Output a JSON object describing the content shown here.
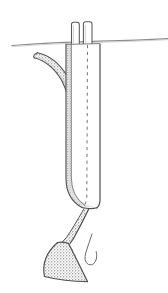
{
  "figure": {
    "title": "Burrowing organism in sediment — schematic line drawing",
    "background_color": "#ffffff",
    "width": 168,
    "height": 293,
    "ink_color": "#4a4a4a",
    "outline_color": "#3f3f3f",
    "stipple_color": "#a8a8a8",
    "stipple_fill": "#bcbcbc",
    "dashed_color": "#6b6b6b",
    "surface_line_color": "#8a8a8a",
    "caption": ""
  },
  "parts": {
    "surface_line": {
      "label": "sediment-surface-line",
      "description": "Slightly curved horizontal line spanning the full image width at the sediment/water interface",
      "x_start": 12,
      "y_start": 45,
      "x_end": 168,
      "y_end": 39,
      "stroke_width": 1.1
    },
    "siphon_left": {
      "label": "left-siphon-tube",
      "description": "Left vertical tube projecting above the surface line",
      "x": 71,
      "y": 22,
      "width": 8,
      "height": 23
    },
    "siphon_right": {
      "label": "right-siphon-tube",
      "description": "Right vertical tube projecting above the surface line",
      "x": 83,
      "y": 22,
      "width": 9,
      "height": 23
    },
    "body": {
      "label": "main-body-shell",
      "description": "Elongated vertical body below the surface, rounded at the base",
      "x_left": 66,
      "x_right": 100,
      "y_top": 44,
      "y_bottom": 208
    },
    "shaded_band": {
      "label": "stippled-shading-band",
      "description": "Narrow stippled band running down the left margin of the body"
    },
    "dashed_centerline": {
      "label": "dashed-outline",
      "description": "Dashed line running down the body interior and continuing diagonally below toward the hook"
    },
    "arm": {
      "label": "curved-arm-appendage",
      "description": "Tapering curved appendage extending upward and to the left from the body",
      "tip_x": 34,
      "tip_y": 59,
      "join_x": 70,
      "join_y": 110
    },
    "foot": {
      "label": "stippled-foot",
      "description": "Stippled triangular fan-shaped foot at lower left",
      "x_range": [
        40,
        88
      ],
      "y_range": [
        238,
        283
      ]
    },
    "foot_stalk": {
      "label": "foot-stalk",
      "description": "Curved stalk linking the body base to the foot"
    },
    "hook": {
      "label": "hook-filament",
      "description": "Thin J-shaped hook curve to the right of the foot"
    }
  }
}
